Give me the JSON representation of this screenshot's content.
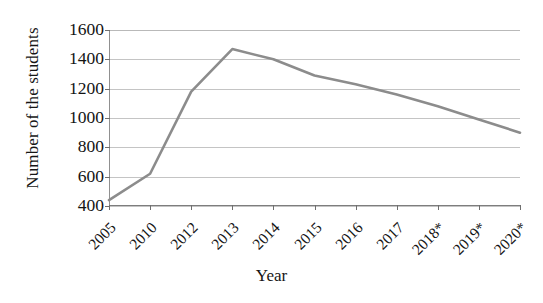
{
  "chart_data": {
    "type": "line",
    "title": "",
    "subtitle": "",
    "xlabel": "Year",
    "ylabel": "Number of the students",
    "categories": [
      "2005",
      "2010",
      "2012",
      "2013",
      "2014",
      "2015",
      "2016",
      "2017",
      "2018*",
      "2019*",
      "2020*"
    ],
    "values": [
      440,
      620,
      1180,
      1470,
      1400,
      1290,
      1230,
      1160,
      1080,
      990,
      900
    ],
    "series": [
      {
        "name": "Number of the students",
        "values": [
          440,
          620,
          1180,
          1470,
          1400,
          1290,
          1230,
          1160,
          1080,
          990,
          900
        ],
        "color": "#8c8c8c"
      }
    ],
    "ylim": [
      400,
      1600
    ],
    "ytick_labels": [
      "400",
      "600",
      "800",
      "1000",
      "1200",
      "1400",
      "1600"
    ],
    "ytick_values": [
      400,
      600,
      800,
      1000,
      1200,
      1400,
      1600
    ],
    "xtick_labels": [
      "2005",
      "2010",
      "2012",
      "2013",
      "2014",
      "2015",
      "2016",
      "2017",
      "2018*",
      "2019*",
      "2020*"
    ],
    "grid": "horizontal",
    "legend": "none",
    "legend_position": "none",
    "annotations": [
      "* denotes projected values"
    ],
    "line_color": "#8c8c8c",
    "gridline_color": "#c4c4c4",
    "axis_color": "#7d7d7d",
    "background_color": "#ffffff",
    "xtick_label_rotation": -45,
    "markers": "none"
  }
}
